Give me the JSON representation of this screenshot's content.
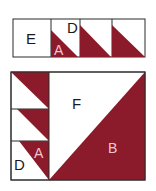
{
  "colors": {
    "maroon": "#8b1a2b",
    "outline": "#2a2a2a",
    "background": "#ffffff",
    "label_on_dark": "#f2c6d0"
  },
  "top_strip": {
    "cells": [
      {
        "label": "E"
      },
      {
        "label_top": "D",
        "label_bottom": "A"
      },
      {},
      {}
    ]
  },
  "bottom_block": {
    "labels": {
      "F": "F",
      "B": "B",
      "D": "D",
      "A": "A"
    }
  }
}
